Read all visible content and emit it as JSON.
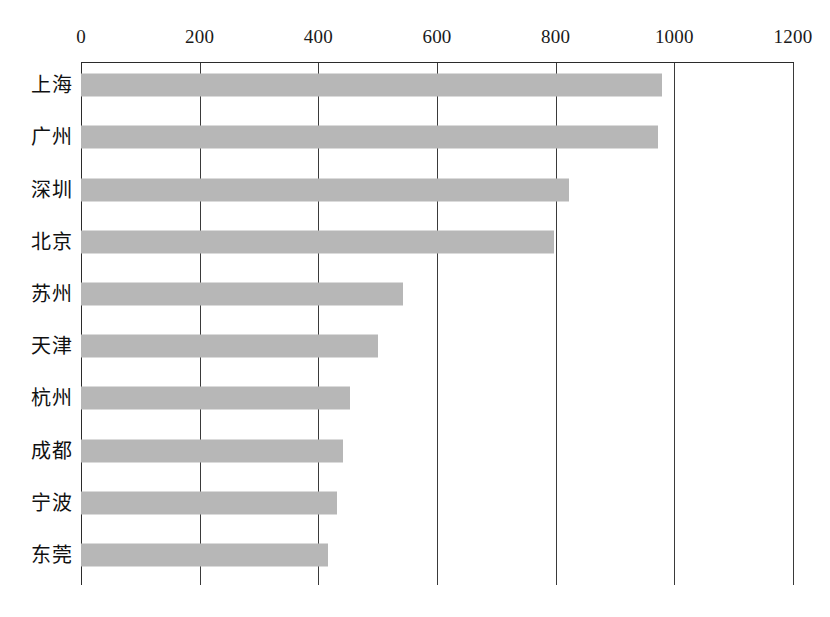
{
  "chart_data": {
    "type": "bar",
    "orientation": "horizontal",
    "title": "",
    "subtitle": "",
    "xlabel": "",
    "ylabel": "",
    "categories": [
      "上海",
      "广州",
      "深圳",
      "北京",
      "苏州",
      "天津",
      "杭州",
      "成都",
      "宁波",
      "东莞"
    ],
    "values": [
      979,
      972,
      822,
      797,
      542,
      501,
      454,
      441,
      432,
      417
    ],
    "series": [
      {
        "name": "",
        "values": [
          979,
          972,
          822,
          797,
          542,
          501,
          454,
          441,
          432,
          417
        ]
      }
    ],
    "xlim": [
      0,
      1200
    ],
    "xticks": [
      0,
      200,
      400,
      600,
      800,
      1000,
      1200
    ],
    "xtick_labels": [
      "0",
      "200",
      "400",
      "600",
      "800",
      "1000",
      "1200"
    ],
    "grid": true,
    "grid_axis": "x",
    "legend": false,
    "legend_position": "none",
    "axis_position": "top",
    "bar_color": "#b7b7b7",
    "axis_color": "#2b2b2b",
    "grid_color": "#3a3a3a",
    "background_color": "#ffffff",
    "annotations": []
  }
}
